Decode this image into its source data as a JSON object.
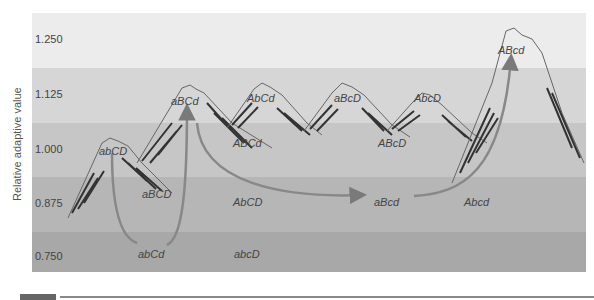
{
  "figure": {
    "ylabel": "Relative adaptive value",
    "bands": [
      {
        "value": "1.250",
        "color": "#ececec"
      },
      {
        "value": "1.125",
        "color": "#d6d6d6"
      },
      {
        "value": "1.000",
        "color": "#c6c6c6"
      },
      {
        "value": "0.875",
        "color": "#b6b6b6"
      },
      {
        "value": "0.750",
        "color": "#a8a8a8"
      }
    ],
    "peaks": [
      {
        "genotype": "abCD",
        "fitness_band": "1.000"
      },
      {
        "genotype": "aBCd",
        "fitness_band": "1.125"
      },
      {
        "genotype": "AbCd",
        "fitness_band": "1.125"
      },
      {
        "genotype": "aBcD",
        "fitness_band": "1.125"
      },
      {
        "genotype": "AbcD",
        "fitness_band": "1.125"
      },
      {
        "genotype": "ABcd",
        "fitness_band": "1.250"
      }
    ],
    "valley_labels": [
      {
        "genotype": "aBCD",
        "fitness_band": "0.875"
      },
      {
        "genotype": "ABCd",
        "fitness_band": "1.000"
      },
      {
        "genotype": "ABcD",
        "fitness_band": "1.000"
      },
      {
        "genotype": "AbCD",
        "fitness_band": "0.875"
      },
      {
        "genotype": "aBcd",
        "fitness_band": "0.875"
      },
      {
        "genotype": "Abcd",
        "fitness_band": "0.875"
      },
      {
        "genotype": "abCd",
        "fitness_band": "0.750"
      },
      {
        "genotype": "abcD",
        "fitness_band": "0.750"
      }
    ],
    "path": [
      "abCD",
      "abCd",
      "aBCd",
      "aBcd",
      "ABcd"
    ]
  }
}
